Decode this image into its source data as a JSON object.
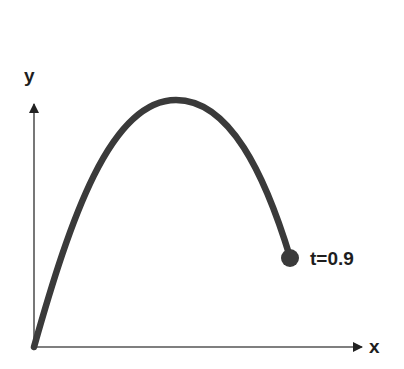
{
  "diagram": {
    "type": "projectile-trajectory",
    "axes": {
      "x_label": "x",
      "y_label": "y"
    },
    "point": {
      "label": "t=0.9"
    },
    "colors": {
      "curve": "#3a3a3a",
      "axis": "#555555",
      "text": "#1e1e1e",
      "background": "#ffffff"
    }
  }
}
